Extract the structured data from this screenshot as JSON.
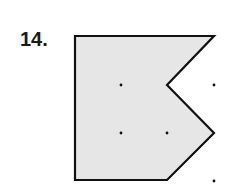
{
  "problem": {
    "number_label": "14."
  },
  "figure": {
    "type": "polygon-on-dot-grid",
    "fill_color": "#e6e6e6",
    "stroke_color": "#111111",
    "grid_x": [
      75,
      121,
      167,
      214
    ],
    "grid_y": [
      36,
      85,
      133,
      180
    ],
    "polygon_points": "75,36 214,36 167,85 214,133 167,180 75,180",
    "interior_dots": [
      [
        121,
        85
      ],
      [
        121,
        133
      ],
      [
        167,
        133
      ]
    ],
    "exterior_dots": [
      [
        214,
        85
      ],
      [
        214,
        181
      ]
    ]
  }
}
